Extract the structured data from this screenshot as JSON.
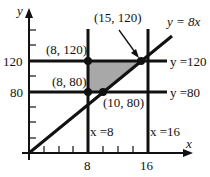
{
  "axes": {
    "x_label": "x",
    "y_label": "y",
    "x_ticks": [
      "8",
      "16"
    ],
    "y_ticks": [
      "80",
      "120"
    ]
  },
  "lines": {
    "diag": "y = 8x",
    "h120": "y =120",
    "h80": "y =80",
    "v8": "x =8",
    "v16": "x =16"
  },
  "points": {
    "p1": "(8, 120)",
    "p2": "(15, 120)",
    "p3": "(8, 80)",
    "p4": "(10, 80)"
  },
  "colors": {
    "ink": "#111111",
    "region": "#a8a8a8"
  }
}
